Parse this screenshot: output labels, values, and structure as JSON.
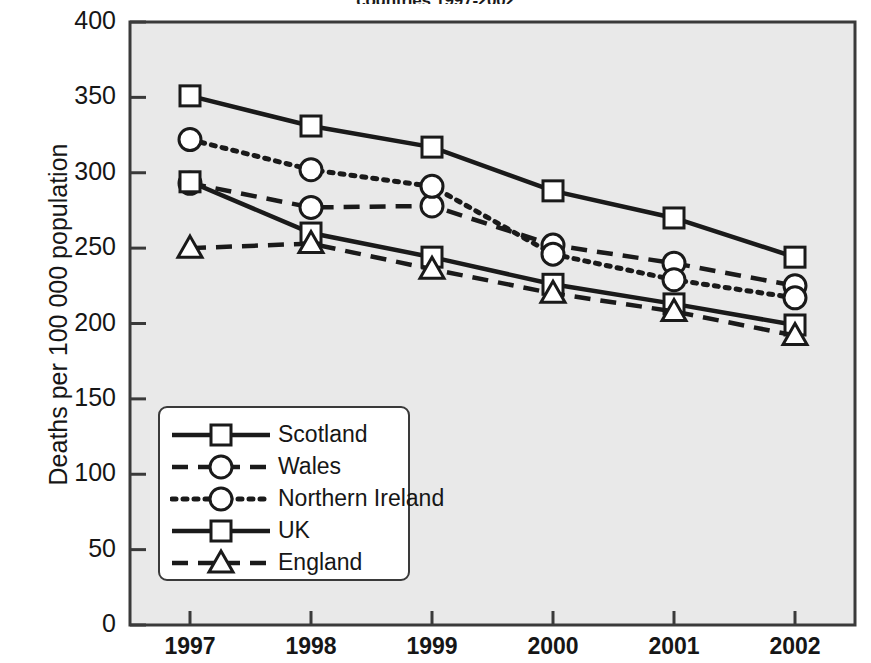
{
  "chart_data": {
    "type": "line",
    "title": "countries 1997-2002",
    "xlabel": "",
    "ylabel": "Deaths per 100 000 population",
    "categories": [
      "1997",
      "1998",
      "1999",
      "2000",
      "2001",
      "2002"
    ],
    "x": [
      1997,
      1998,
      1999,
      2000,
      2001,
      2002
    ],
    "ylim": [
      0,
      400
    ],
    "yticks": [
      "0",
      "50",
      "100",
      "150",
      "200",
      "250",
      "300",
      "350",
      "400"
    ],
    "ytick_values": [
      0,
      50,
      100,
      150,
      200,
      250,
      300,
      350,
      400
    ],
    "grid": false,
    "legend_position": "lower-left-inside",
    "series": [
      {
        "name": "Scotland",
        "values": [
          351,
          331,
          317,
          288,
          270,
          244
        ],
        "linestyle": "solid",
        "marker": "square",
        "color": "#1a1a1a"
      },
      {
        "name": "Wales",
        "values": [
          293,
          277,
          278,
          252,
          240,
          225
        ],
        "linestyle": "dashed",
        "marker": "circle",
        "color": "#1a1a1a"
      },
      {
        "name": "Northern Ireland",
        "values": [
          322,
          302,
          291,
          246,
          229,
          217
        ],
        "linestyle": "dotted",
        "marker": "circle",
        "color": "#1a1a1a"
      },
      {
        "name": "UK",
        "values": [
          294,
          260,
          244,
          226,
          213,
          199
        ],
        "linestyle": "solid",
        "marker": "square",
        "color": "#1a1a1a"
      },
      {
        "name": "England",
        "values": [
          250,
          253,
          236,
          220,
          208,
          192
        ],
        "linestyle": "dashed",
        "marker": "triangle",
        "color": "#1a1a1a"
      }
    ],
    "plot_background": "#e9e9e9",
    "axis_color": "#3a3a3a"
  }
}
